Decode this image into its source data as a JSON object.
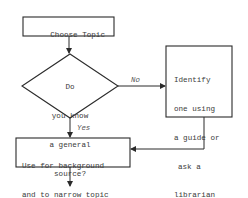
{
  "flowchart": {
    "nodes": {
      "start": {
        "type": "process",
        "lines": [
          "Choose Topic"
        ]
      },
      "decision": {
        "type": "decision",
        "lines": [
          "Do",
          "you know",
          "a general",
          "source?"
        ]
      },
      "identify": {
        "type": "process",
        "lines": [
          "Identify",
          "one using",
          "a guide or",
          "ask a",
          "librarian"
        ]
      },
      "use": {
        "type": "process",
        "lines": [
          "Use for background",
          "and to narrow topic"
        ]
      }
    },
    "edges": {
      "no_label": "No",
      "yes_label": "Yes"
    }
  },
  "colors": {
    "line": "#2a2a2a",
    "text": "#3a3a3a",
    "background": "#ffffff"
  }
}
